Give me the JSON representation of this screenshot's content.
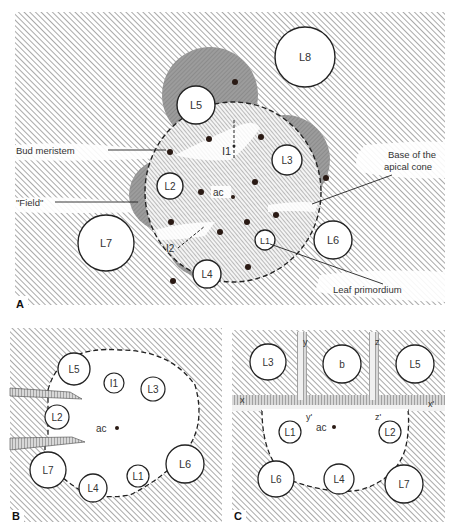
{
  "figure": {
    "panels": [
      {
        "id": "A",
        "letter": "A",
        "callouts": {
          "bud_meristem": "Bud meristem",
          "field": "\"Field\"",
          "base_line1": "Base of the",
          "base_line2": "apical cone",
          "leaf_primordium": "Leaf primordium"
        },
        "primordia": [
          "L1",
          "L2",
          "L3",
          "L4",
          "L5",
          "L6",
          "L7",
          "L8"
        ],
        "incipient": [
          "I1",
          "I2"
        ],
        "center_label": "ac"
      },
      {
        "id": "B",
        "letter": "B",
        "primordia": [
          "L1",
          "L2",
          "L3",
          "L4",
          "L5",
          "L6",
          "L7"
        ],
        "incipient": [
          "I1"
        ],
        "center_label": "ac"
      },
      {
        "id": "C",
        "letter": "C",
        "primordia": [
          "L1",
          "L2",
          "L3",
          "L4",
          "L5",
          "L6",
          "L7"
        ],
        "bud_label": "b",
        "cut_labels": [
          "x",
          "x'",
          "y",
          "y'",
          "z",
          "z'"
        ],
        "center_label": "ac"
      }
    ],
    "colors": {
      "hatch": "#6f6f6f",
      "field_shade": "#9a9a9a",
      "ink": "#222222",
      "dot": "#2a1a14",
      "paper": "#ffffff"
    }
  }
}
